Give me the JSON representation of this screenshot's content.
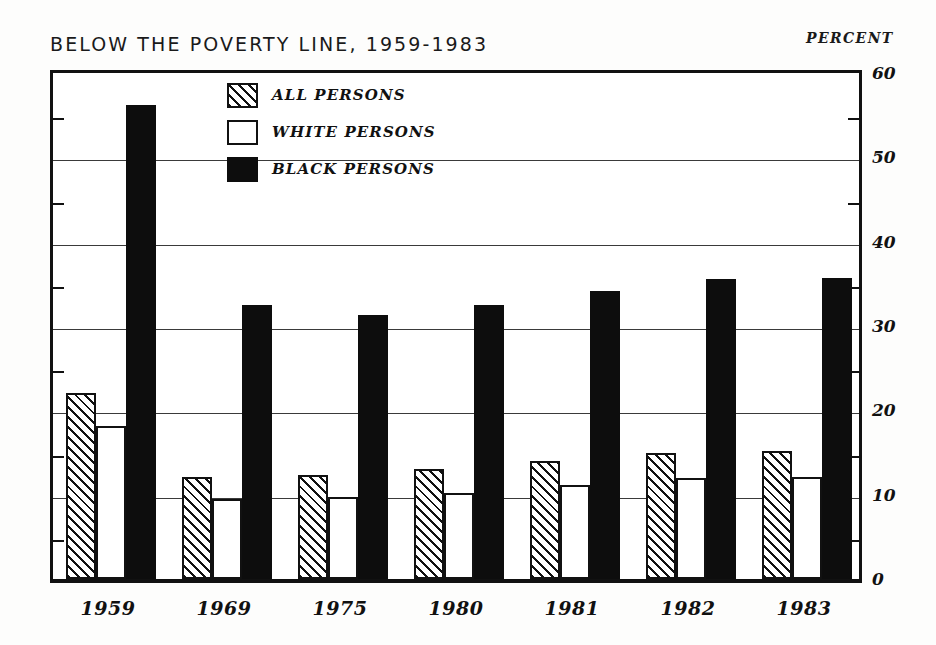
{
  "chart_data": {
    "type": "bar",
    "title": "BELOW THE POVERTY LINE, 1959-1983",
    "xlabel": "",
    "ylabel": "PERCENT",
    "ylim": [
      0,
      60
    ],
    "ytick_step": 10,
    "yminor_step": 5,
    "grid": true,
    "legend_position": "upper-left-inside",
    "categories": [
      "1959",
      "1969",
      "1975",
      "1980",
      "1981",
      "1982",
      "1983"
    ],
    "yticks": [
      "0",
      "10",
      "20",
      "30",
      "40",
      "50",
      "60"
    ],
    "series": [
      {
        "name": "ALL PERSONS",
        "pattern": "hatched",
        "color": "#111111",
        "values": [
          22.0,
          12.1,
          12.3,
          13.0,
          14.0,
          15.0,
          15.2
        ]
      },
      {
        "name": "WHITE PERSONS",
        "pattern": "open",
        "color": "#ffffff",
        "values": [
          18.1,
          9.5,
          9.7,
          10.2,
          11.1,
          12.0,
          12.1
        ]
      },
      {
        "name": "BLACK PERSONS",
        "pattern": "solid",
        "color": "#0d0d0d",
        "values": [
          56.2,
          32.5,
          31.3,
          32.5,
          34.2,
          35.6,
          35.7
        ]
      }
    ]
  },
  "legend": {
    "entries": [
      {
        "label": "ALL PERSONS"
      },
      {
        "label": "WHITE PERSONS"
      },
      {
        "label": "BLACK PERSONS"
      }
    ]
  }
}
